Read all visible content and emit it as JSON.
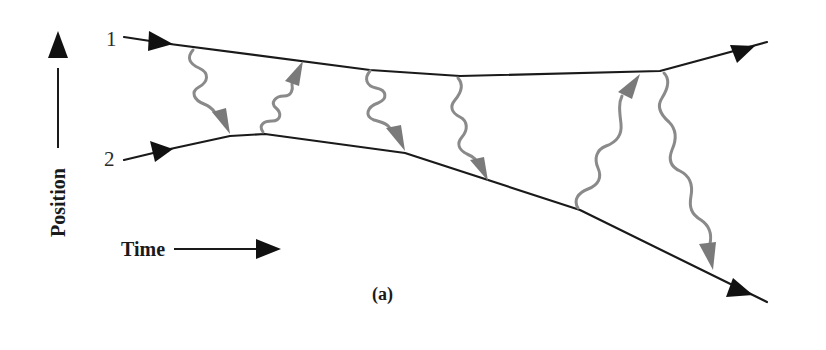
{
  "diagram": {
    "type": "spacetime-photon-exchange",
    "particles": [
      {
        "id": "1",
        "label": "1"
      },
      {
        "id": "2",
        "label": "2"
      }
    ],
    "axes": {
      "vertical_label": "Position",
      "horizontal_label": "Time"
    },
    "caption": "(a)",
    "photon_exchanges": [
      {
        "from": "1",
        "to": "2"
      },
      {
        "from": "2",
        "to": "1"
      },
      {
        "from": "1",
        "to": "2"
      },
      {
        "from": "1",
        "to": "2"
      },
      {
        "from": "2",
        "to": "1"
      },
      {
        "from": "1",
        "to": "2"
      }
    ],
    "colors": {
      "worldline": "#1a1a1a",
      "photon": "#8a8a8a",
      "background": "#ffffff"
    }
  }
}
